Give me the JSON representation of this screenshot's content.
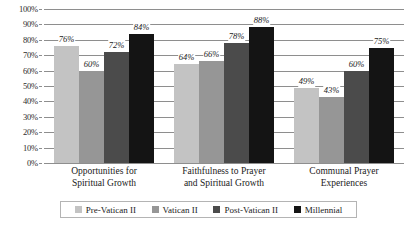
{
  "chart_data": {
    "type": "bar",
    "title": "",
    "xlabel": "",
    "ylabel": "",
    "ylim": [
      0,
      100
    ],
    "ytick_labels": [
      "100%",
      "90%",
      "80%",
      "70%",
      "60%",
      "50%",
      "40%",
      "30%",
      "20%",
      "10%",
      "0%"
    ],
    "ytick_values": [
      100,
      90,
      80,
      70,
      60,
      50,
      40,
      30,
      20,
      10,
      0
    ],
    "grid": true,
    "legend_position": "bottom",
    "value_suffix": "%",
    "categories": [
      "Opportunities for Spiritual Growth",
      "Faithfulness to Prayer and Spiritual Growth",
      "Communal Prayer Experiences"
    ],
    "category_lines": [
      [
        "Opportunities for",
        "Spiritual Growth"
      ],
      [
        "Faithfulness to Prayer",
        "and Spiritual Growth"
      ],
      [
        "Communal Prayer",
        "Experiences"
      ]
    ],
    "series": [
      {
        "name": "Pre-Vatican II",
        "color": "#c3c3c3",
        "values": [
          76,
          64,
          49
        ],
        "labels": [
          "76%",
          "64%",
          "49%"
        ]
      },
      {
        "name": "Vatican II",
        "color": "#969696",
        "values": [
          60,
          66,
          43
        ],
        "labels": [
          "60%",
          "66%",
          "43%"
        ]
      },
      {
        "name": "Post-Vatican II",
        "color": "#4b4b4b",
        "values": [
          72,
          78,
          60
        ],
        "labels": [
          "72%",
          "78%",
          "60%"
        ]
      },
      {
        "name": "Millennial",
        "color": "#141414",
        "values": [
          84,
          88,
          75
        ],
        "labels": [
          "84%",
          "88%",
          "75%"
        ]
      }
    ]
  },
  "legend": {
    "items": [
      {
        "label": "Pre-Vatican II",
        "color": "#c3c3c3"
      },
      {
        "label": "Vatican II",
        "color": "#969696"
      },
      {
        "label": "Post-Vatican II",
        "color": "#4b4b4b"
      },
      {
        "label": "Millennial",
        "color": "#141414"
      }
    ]
  }
}
